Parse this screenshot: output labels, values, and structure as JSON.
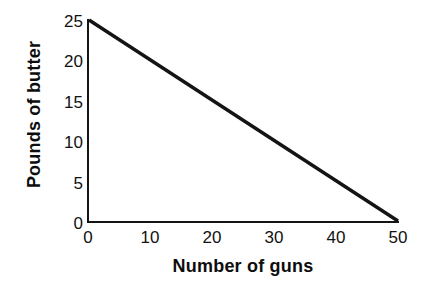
{
  "chart_data": {
    "type": "line",
    "title": "",
    "xlabel": "Number of guns",
    "ylabel": "Pounds of butter",
    "xlim": [
      0,
      50
    ],
    "ylim": [
      0,
      25
    ],
    "xticks": [
      "0",
      "10",
      "20",
      "30",
      "40",
      "50"
    ],
    "yticks": [
      "0",
      "5",
      "10",
      "15",
      "20",
      "25"
    ],
    "grid": false,
    "legend": null,
    "series": [
      {
        "name": "production possibilities frontier",
        "x": [
          0,
          50
        ],
        "values": [
          25,
          0
        ],
        "color": "#141414"
      }
    ],
    "annotations": []
  },
  "axes": {
    "line_color": "#141414",
    "background": "#ffffff"
  }
}
